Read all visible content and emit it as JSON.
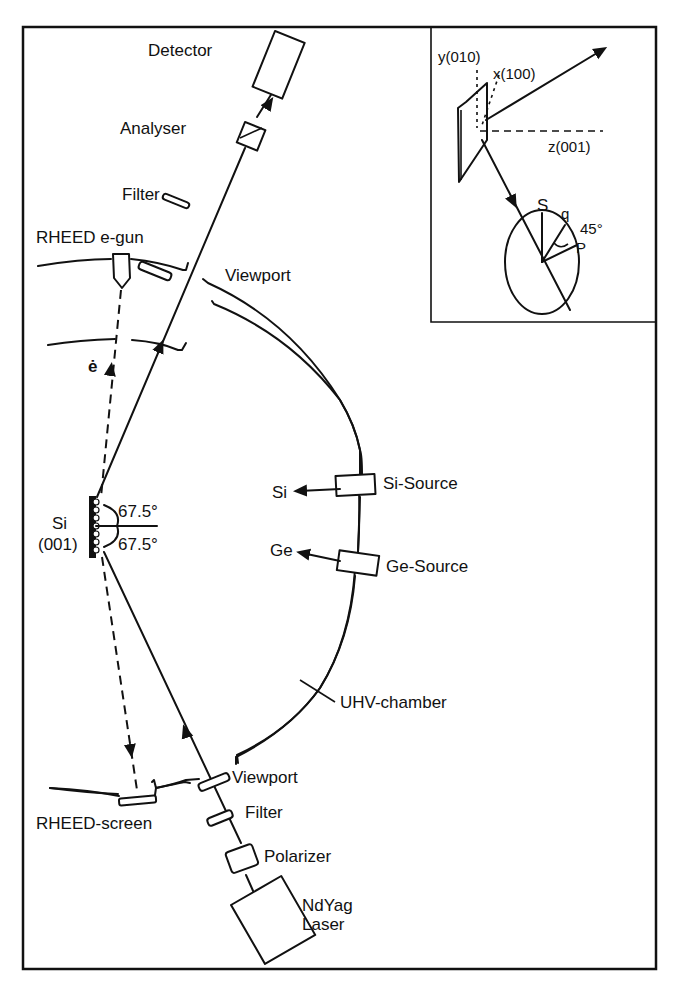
{
  "figure": {
    "labels": {
      "detector": "Detector",
      "analyser": "Analyser",
      "filter_top": "Filter",
      "rheed_egun": "RHEED e-gun",
      "viewport_top": "Viewport",
      "electron": "ė",
      "si_sample_line1": "Si",
      "si_sample_line2": "(001)",
      "angle_upper": "67.5°",
      "angle_lower": "67.5°",
      "si_beam": "Si",
      "si_source": "Si-Source",
      "ge_beam": "Ge",
      "ge_source": "Ge-Source",
      "uhv_chamber": "UHV-chamber",
      "viewport_bottom": "Viewport",
      "rheed_screen": "RHEED-screen",
      "filter_bottom": "Filter",
      "polarizer": "Polarizer",
      "laser_line1": "NdYag",
      "laser_line2": "Laser"
    },
    "inset": {
      "axis_y": "y(010)",
      "axis_x": "x(100)",
      "axis_z": "z(001)",
      "pol_s": "S",
      "pol_q": "q",
      "pol_p": "P",
      "pol_angle": "45°"
    }
  }
}
